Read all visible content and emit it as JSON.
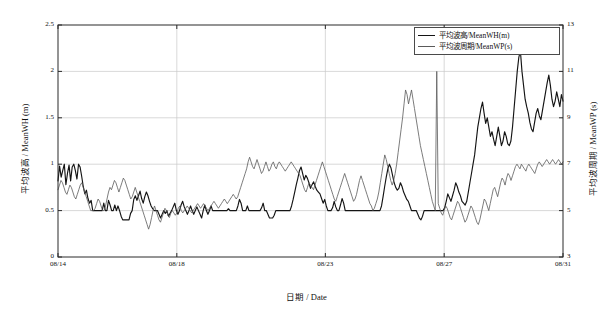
{
  "chart_data": {
    "type": "line",
    "title": "",
    "xlabel": "日期 / Date",
    "ylabel": "平均波高 / MeanWH (m)",
    "ylabel_right": "平均波周期 / MeanWP (s)",
    "grid": true,
    "legend_position": "top-right",
    "xlim": [
      0,
      17
    ],
    "xticks": [
      0,
      4,
      9,
      13,
      17
    ],
    "xtick_labels": [
      "08/14",
      "08/18",
      "08/23",
      "08/27",
      "08/31"
    ],
    "ylim": [
      0,
      2.5
    ],
    "yticks": [
      0,
      0.5,
      1,
      1.5,
      2,
      2.5
    ],
    "ytick_labels": [
      "0",
      "0.5",
      "1",
      "1.5",
      "2",
      "2.5"
    ],
    "ylim_right": [
      3,
      13
    ],
    "yticks_right": [
      3,
      5,
      7,
      9,
      11,
      13
    ],
    "ytick_labels_right": [
      "3",
      "5",
      "7",
      "9",
      "11",
      "13"
    ],
    "series": [
      {
        "name": "平均波高/MeanWH(m)",
        "axis": "left",
        "color": "#141414",
        "width": 1.15,
        "unit": "m",
        "values": [
          0.82,
          0.98,
          0.86,
          0.93,
          1.0,
          0.78,
          0.9,
          0.99,
          0.82,
          0.97,
          1.0,
          0.93,
          0.84,
          1.0,
          0.97,
          0.87,
          0.76,
          0.68,
          0.72,
          0.63,
          0.58,
          0.61,
          0.5,
          0.5,
          0.5,
          0.5,
          0.5,
          0.5,
          0.5,
          0.58,
          0.5,
          0.5,
          0.61,
          0.56,
          0.5,
          0.5,
          0.56,
          0.5,
          0.55,
          0.5,
          0.44,
          0.4,
          0.4,
          0.4,
          0.4,
          0.4,
          0.47,
          0.5,
          0.62,
          0.66,
          0.61,
          0.66,
          0.71,
          0.63,
          0.58,
          0.65,
          0.7,
          0.66,
          0.6,
          0.55,
          0.52,
          0.5,
          0.5,
          0.5,
          0.46,
          0.42,
          0.46,
          0.5,
          0.47,
          0.5,
          0.44,
          0.47,
          0.5,
          0.54,
          0.58,
          0.5,
          0.46,
          0.5,
          0.56,
          0.6,
          0.54,
          0.5,
          0.46,
          0.5,
          0.55,
          0.5,
          0.46,
          0.5,
          0.54,
          0.5,
          0.46,
          0.42,
          0.5,
          0.56,
          0.5,
          0.46,
          0.5,
          0.55,
          0.5,
          0.5,
          0.5,
          0.5,
          0.5,
          0.5,
          0.5,
          0.5,
          0.5,
          0.5,
          0.52,
          0.5,
          0.5,
          0.5,
          0.5,
          0.5,
          0.55,
          0.62,
          0.58,
          0.5,
          0.5,
          0.5,
          0.55,
          0.5,
          0.5,
          0.5,
          0.5,
          0.5,
          0.5,
          0.5,
          0.5,
          0.53,
          0.58,
          0.5,
          0.5,
          0.46,
          0.42,
          0.42,
          0.42,
          0.45,
          0.5,
          0.5,
          0.5,
          0.5,
          0.5,
          0.5,
          0.5,
          0.5,
          0.5,
          0.5,
          0.55,
          0.62,
          0.7,
          0.78,
          0.85,
          0.93,
          0.97,
          0.9,
          0.83,
          0.88,
          0.85,
          0.8,
          0.74,
          0.78,
          0.81,
          0.76,
          0.72,
          0.7,
          0.68,
          0.63,
          0.58,
          0.62,
          0.55,
          0.5,
          0.5,
          0.5,
          0.53,
          0.6,
          0.54,
          0.5,
          0.5,
          0.56,
          0.63,
          0.58,
          0.5,
          0.5,
          0.5,
          0.5,
          0.5,
          0.5,
          0.5,
          0.5,
          0.5,
          0.5,
          0.5,
          0.5,
          0.5,
          0.5,
          0.5,
          0.5,
          0.5,
          0.5,
          0.5,
          0.5,
          0.5,
          0.5,
          0.5,
          0.55,
          0.65,
          0.76,
          0.86,
          0.95,
          1.0,
          0.96,
          0.88,
          0.8,
          0.75,
          0.72,
          0.74,
          0.8,
          0.76,
          0.7,
          0.66,
          0.62,
          0.6,
          0.55,
          0.5,
          0.5,
          0.5,
          0.5,
          0.46,
          0.42,
          0.4,
          0.44,
          0.5,
          0.5,
          0.5,
          0.5,
          0.5,
          0.5,
          0.5,
          0.5,
          0.5,
          0.5,
          0.5,
          0.5,
          0.5,
          0.53,
          0.6,
          0.68,
          0.64,
          0.6,
          0.66,
          0.72,
          0.8,
          0.76,
          0.7,
          0.66,
          0.6,
          0.58,
          0.56,
          0.6,
          0.7,
          0.8,
          0.9,
          1.0,
          1.1,
          1.25,
          1.4,
          1.5,
          1.6,
          1.67,
          1.55,
          1.44,
          1.5,
          1.4,
          1.3,
          1.35,
          1.27,
          1.2,
          1.3,
          1.4,
          1.3,
          1.2,
          1.25,
          1.35,
          1.3,
          1.22,
          1.2,
          1.25,
          1.4,
          1.6,
          1.8,
          2.0,
          2.15,
          2.22,
          2.0,
          1.85,
          1.7,
          1.62,
          1.55,
          1.45,
          1.38,
          1.35,
          1.45,
          1.55,
          1.6,
          1.52,
          1.48,
          1.58,
          1.68,
          1.78,
          1.88,
          1.96,
          1.85,
          1.7,
          1.62,
          1.68,
          1.78,
          1.7,
          1.62,
          1.75,
          1.68
        ]
      },
      {
        "name": "平均波周期/MeanWP(s)",
        "axis": "right",
        "color": "#5a5a5a",
        "width": 0.8,
        "unit": "s",
        "values": [
          5.9,
          6.1,
          6.3,
          6.2,
          6.0,
          5.8,
          5.7,
          5.9,
          6.1,
          6.0,
          5.8,
          5.6,
          5.5,
          5.7,
          5.9,
          6.1,
          6.2,
          6.0,
          5.8,
          5.6,
          5.4,
          5.2,
          5.0,
          5.0,
          5.0,
          5.1,
          5.3,
          5.5,
          5.4,
          5.2,
          5.0,
          5.0,
          5.2,
          5.5,
          5.8,
          6.0,
          5.9,
          6.1,
          6.3,
          6.2,
          6.0,
          5.8,
          6.0,
          6.2,
          6.4,
          6.3,
          6.1,
          5.9,
          5.7,
          5.5,
          5.6,
          5.8,
          6.0,
          5.8,
          5.6,
          5.4,
          5.2,
          5.0,
          4.8,
          4.6,
          4.4,
          4.2,
          4.4,
          4.7,
          5.0,
          5.2,
          5.0,
          4.8,
          4.6,
          4.5,
          4.7,
          4.9,
          5.1,
          5.0,
          4.8,
          4.7,
          4.9,
          5.0,
          4.9,
          4.8,
          4.9,
          5.1,
          5.2,
          5.0,
          4.9,
          5.0,
          5.1,
          5.2,
          5.1,
          5.0,
          4.9,
          5.0,
          5.1,
          5.2,
          5.3,
          5.2,
          5.1,
          5.2,
          5.3,
          5.2,
          5.1,
          5.0,
          5.1,
          5.2,
          5.3,
          5.4,
          5.3,
          5.2,
          5.1,
          5.2,
          5.3,
          5.4,
          5.5,
          5.4,
          5.3,
          5.4,
          5.5,
          5.6,
          5.7,
          5.6,
          5.5,
          5.6,
          5.8,
          6.0,
          6.2,
          6.4,
          6.6,
          6.8,
          7.1,
          7.3,
          7.1,
          6.9,
          6.8,
          7.0,
          7.2,
          7.0,
          6.8,
          6.6,
          6.7,
          6.9,
          7.1,
          6.9,
          6.7,
          6.8,
          7.0,
          7.1,
          6.9,
          6.8,
          7.0,
          7.1,
          7.0,
          6.9,
          6.8,
          6.7,
          6.8,
          6.9,
          7.0,
          7.1,
          7.0,
          6.9,
          6.8,
          6.7,
          6.6,
          6.5,
          6.3,
          6.1,
          5.9,
          5.8,
          6.0,
          6.2,
          6.1,
          6.0,
          5.9,
          6.1,
          6.3,
          6.5,
          6.7,
          6.9,
          7.1,
          6.9,
          6.7,
          6.5,
          6.3,
          6.1,
          5.9,
          5.7,
          5.5,
          5.4,
          5.6,
          5.8,
          6.0,
          6.2,
          6.4,
          6.6,
          6.4,
          6.2,
          6.0,
          5.8,
          5.6,
          5.4,
          5.5,
          5.7,
          6.0,
          6.3,
          6.5,
          6.3,
          6.1,
          5.9,
          5.7,
          5.5,
          5.3,
          5.2,
          5.0,
          5.1,
          5.3,
          5.5,
          5.8,
          6.2,
          6.6,
          7.0,
          7.4,
          7.2,
          6.9,
          6.6,
          6.3,
          6.1,
          6.3,
          6.6,
          7.0,
          7.5,
          8.0,
          8.5,
          9.0,
          9.6,
          10.2,
          10.0,
          9.6,
          9.9,
          10.2,
          9.8,
          9.4,
          9.0,
          8.6,
          8.2,
          7.8,
          7.5,
          7.2,
          6.9,
          6.6,
          6.3,
          6.0,
          5.7,
          5.4,
          5.2,
          5.0,
          11.0,
          5.3,
          5.1,
          4.9,
          4.8,
          5.0,
          5.2,
          5.1,
          4.9,
          4.7,
          4.6,
          4.8,
          5.0,
          5.2,
          5.4,
          5.3,
          5.1,
          4.9,
          4.7,
          4.5,
          4.6,
          4.8,
          5.0,
          5.2,
          5.1,
          4.9,
          4.7,
          4.5,
          4.4,
          4.6,
          4.9,
          5.2,
          5.5,
          5.4,
          5.2,
          5.0,
          5.3,
          5.6,
          5.9,
          6.0,
          5.8,
          5.6,
          5.9,
          6.2,
          6.4,
          6.3,
          6.1,
          6.4,
          6.6,
          6.5,
          6.3,
          6.5,
          6.7,
          6.9,
          7.0,
          6.9,
          6.8,
          7.0,
          6.9,
          6.8,
          6.7,
          6.9,
          7.0,
          6.9,
          6.8,
          6.7,
          6.6,
          6.8,
          7.0,
          7.1,
          7.0,
          6.9,
          7.0,
          7.1,
          7.2,
          7.1,
          7.0,
          7.1,
          7.2,
          7.1,
          7.0,
          7.1,
          7.2,
          7.1,
          7.0,
          7.1
        ]
      }
    ]
  },
  "legend": {
    "entries": [
      {
        "label": "平均波高/MeanWH(m)"
      },
      {
        "label": "平均波周期/MeanWP(s)"
      }
    ]
  }
}
